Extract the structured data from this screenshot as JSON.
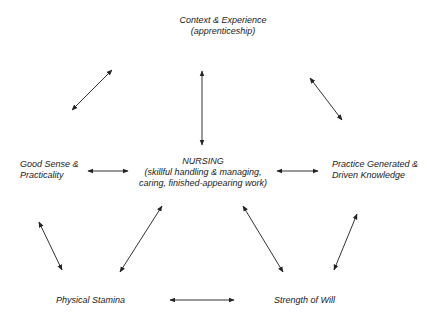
{
  "diagram": {
    "type": "concept-map",
    "nodes": {
      "top": {
        "line1": "Context & Experience",
        "line2": "(apprenticeship)"
      },
      "center": {
        "line1": "NURSING",
        "line2": "(skillful handling & managing,",
        "line3": "caring, finished-appearing work)"
      },
      "left": {
        "line1": "Good Sense &",
        "line2": "Practicality"
      },
      "right": {
        "line1": "Practice Generated &",
        "line2": "Driven Knowledge"
      },
      "bottom_left": {
        "line1": "Physical Stamina"
      },
      "bottom_right": {
        "line1": "Strength of Will"
      }
    },
    "edges": [
      {
        "from": "top",
        "to": "left",
        "style": "double-arrow"
      },
      {
        "from": "top",
        "to": "center",
        "style": "double-arrow"
      },
      {
        "from": "top",
        "to": "right",
        "style": "double-arrow"
      },
      {
        "from": "left",
        "to": "center",
        "style": "double-arrow"
      },
      {
        "from": "center",
        "to": "right",
        "style": "double-arrow"
      },
      {
        "from": "left",
        "to": "bottom_left",
        "style": "double-arrow"
      },
      {
        "from": "center",
        "to": "bottom_left",
        "style": "double-arrow"
      },
      {
        "from": "center",
        "to": "bottom_right",
        "style": "double-arrow"
      },
      {
        "from": "right",
        "to": "bottom_right",
        "style": "double-arrow"
      },
      {
        "from": "bottom_left",
        "to": "bottom_right",
        "style": "double-arrow"
      }
    ],
    "colors": {
      "text": "#1a1a1a",
      "arrow": "#222222",
      "background": "#ffffff"
    }
  }
}
